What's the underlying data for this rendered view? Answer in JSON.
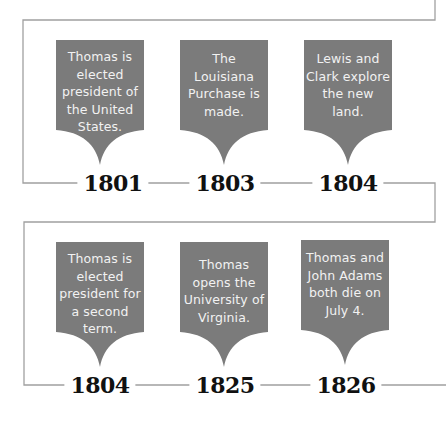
{
  "colors": {
    "card_fill": "#7b7b7b",
    "card_text": "#f2f2f2",
    "line": "#9a9a9a",
    "year_text": "#111111"
  },
  "timeline": {
    "rows": [
      {
        "events": [
          {
            "year": "1801",
            "text": "Thomas is elected president of the United States."
          },
          {
            "year": "1803",
            "text": "The Louisiana Purchase is made."
          },
          {
            "year": "1804",
            "text": "Lewis and Clark explore the new land."
          }
        ]
      },
      {
        "events": [
          {
            "year": "1804",
            "text": "Thomas is elected president for a second term."
          },
          {
            "year": "1825",
            "text": "Thomas opens the University of Virginia."
          },
          {
            "year": "1826",
            "text": "Thomas and John Adams both die on July 4."
          }
        ]
      }
    ]
  }
}
